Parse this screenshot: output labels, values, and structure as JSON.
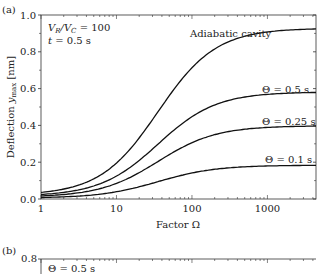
{
  "panel_a": {
    "label": "(a)",
    "params_line1": "V_R/V_C = 100",
    "params_line2": "t = 0.5 s",
    "xlabel": "Factor Ω",
    "ylabel": "Deflection y_max [nm]",
    "x_ticks": [
      "1",
      "10",
      "100",
      "1000"
    ],
    "y_ticks": [
      "0.0",
      "0.2",
      "0.4",
      "0.6",
      "0.8",
      "1.0"
    ],
    "curve_labels": {
      "adiabatic": "Adiabatic cavity",
      "theta05": "Θ = 0.5 s",
      "theta025": "Θ = 0.25 s",
      "theta01": "Θ = 0.1 s"
    }
  },
  "panel_b": {
    "label": "(b)",
    "y_top_tick": "0.8",
    "first_label": "Θ = 0.5 s"
  },
  "chart_data": [
    {
      "type": "line",
      "title": "(a)",
      "xlabel": "Factor Ω",
      "ylabel": "Deflection y_max [nm]",
      "xscale": "log",
      "xlim": [
        1,
        4400
      ],
      "ylim": [
        0.0,
        1.0
      ],
      "annotations": [
        "V_R/V_C = 100",
        "t = 0.5 s"
      ],
      "x": [
        1,
        3,
        10,
        30,
        100,
        300,
        1000,
        4000
      ],
      "series": [
        {
          "name": "Adiabatic cavity",
          "values": [
            0.02,
            0.04,
            0.12,
            0.33,
            0.62,
            0.8,
            0.88,
            0.91
          ]
        },
        {
          "name": "Θ = 0.5 s",
          "values": [
            0.015,
            0.03,
            0.09,
            0.22,
            0.4,
            0.51,
            0.56,
            0.57
          ]
        },
        {
          "name": "Θ = 0.25 s",
          "values": [
            0.01,
            0.02,
            0.06,
            0.15,
            0.27,
            0.35,
            0.38,
            0.39
          ]
        },
        {
          "name": "Θ = 0.1 s",
          "values": [
            0.005,
            0.01,
            0.03,
            0.07,
            0.12,
            0.16,
            0.17,
            0.18
          ]
        }
      ],
      "grid": false,
      "legend": "inline labels"
    },
    {
      "type": "line",
      "title": "(b)",
      "ylim": [
        null,
        0.8
      ],
      "annotations": [
        "Θ = 0.5 s"
      ],
      "series": []
    }
  ]
}
